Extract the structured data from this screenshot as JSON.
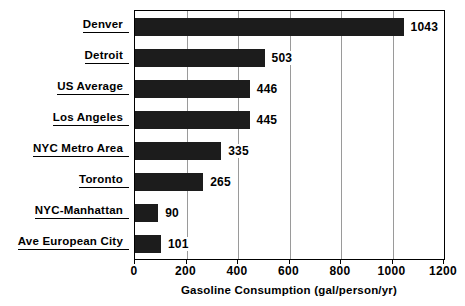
{
  "chart_data": {
    "type": "bar",
    "orientation": "horizontal",
    "title": "",
    "xlabel": "Gasoline Consumption (gal/person/yr)",
    "ylabel": "",
    "categories": [
      "Denver",
      "Detroit",
      "US Average",
      "Los Angeles",
      "NYC Metro Area",
      "Toronto",
      "NYC-Manhattan",
      "Ave European City"
    ],
    "values": [
      1043,
      503,
      446,
      445,
      335,
      265,
      90,
      101
    ],
    "value_labels": [
      "1043",
      "503",
      "446",
      "445",
      "335",
      "265",
      "90",
      "101"
    ],
    "xlim": [
      0,
      1200
    ],
    "xticks": [
      0,
      200,
      400,
      600,
      800,
      1000,
      1200
    ],
    "xtick_labels": [
      "0",
      "200",
      "400",
      "600",
      "800",
      "1000",
      "1200"
    ],
    "grid": true,
    "grid_axis": "x",
    "legend": false,
    "bar_color": "#1c1c1c",
    "grid_color": "#9a9a9a",
    "axis_color": "#000000",
    "background_color": "#ffffff"
  }
}
